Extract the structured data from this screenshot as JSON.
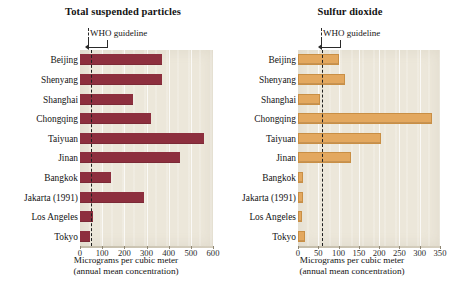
{
  "chart_data": [
    {
      "type": "bar",
      "orientation": "horizontal",
      "title": "Total suspended particles",
      "categories": [
        "Beijing",
        "Shenyang",
        "Shanghai",
        "Chongqing",
        "Taiyuan",
        "Jinan",
        "Bangkok",
        "Jakarta (1991)",
        "Los Angeles",
        "Tokyo"
      ],
      "values": [
        370,
        370,
        240,
        320,
        560,
        450,
        140,
        290,
        60,
        45
      ],
      "xlabel": "Micrograms per cubic meter",
      "xlabel_sub": "(annual mean concentration)",
      "ylabel": "",
      "xlim": [
        0,
        600
      ],
      "xticks": [
        "0",
        "100",
        "200",
        "300",
        "400",
        "500",
        "600"
      ],
      "xtick_values": [
        0,
        100,
        200,
        300,
        400,
        500,
        600
      ],
      "grid": true,
      "legend": "none",
      "annotations": [
        {
          "label": "WHO guideline",
          "value": 50,
          "style": "dashed-vertical-line"
        }
      ],
      "bar_color": "#8d2f3e",
      "plot_background": "#ece7da"
    },
    {
      "type": "bar",
      "orientation": "horizontal",
      "title": "Sulfur dioxide",
      "categories": [
        "Beijing",
        "Shenyang",
        "Shanghai",
        "Chongqing",
        "Taiyuan",
        "Jinan",
        "Bangkok",
        "Jakarta (1991)",
        "Los Angeles",
        "Tokyo"
      ],
      "values": [
        100,
        115,
        55,
        330,
        205,
        130,
        12,
        12,
        10,
        18
      ],
      "xlabel": "Micrograms per cubic meter",
      "xlabel_sub": "(annual mean concentration)",
      "ylabel": "",
      "xlim": [
        0,
        350
      ],
      "xticks": [
        "0",
        "50",
        "100",
        "150",
        "200",
        "250",
        "300",
        "350"
      ],
      "xtick_values": [
        0,
        50,
        100,
        150,
        200,
        250,
        300,
        350
      ],
      "grid": true,
      "legend": "none",
      "annotations": [
        {
          "label": "WHO guideline",
          "value": 60,
          "style": "dashed-vertical-line"
        }
      ],
      "bar_color": "#e3a85f",
      "plot_background": "#ece7da"
    }
  ],
  "figure": {
    "panels": [
      {
        "id": "tsp",
        "title": "Total suspended particles"
      },
      {
        "id": "so2",
        "title": "Sulfur dioxide"
      }
    ],
    "shared_axis_title": "Micrograms per cubic meter",
    "shared_axis_subtitle": "(annual mean concentration)",
    "guideline_label": "WHO guideline"
  }
}
